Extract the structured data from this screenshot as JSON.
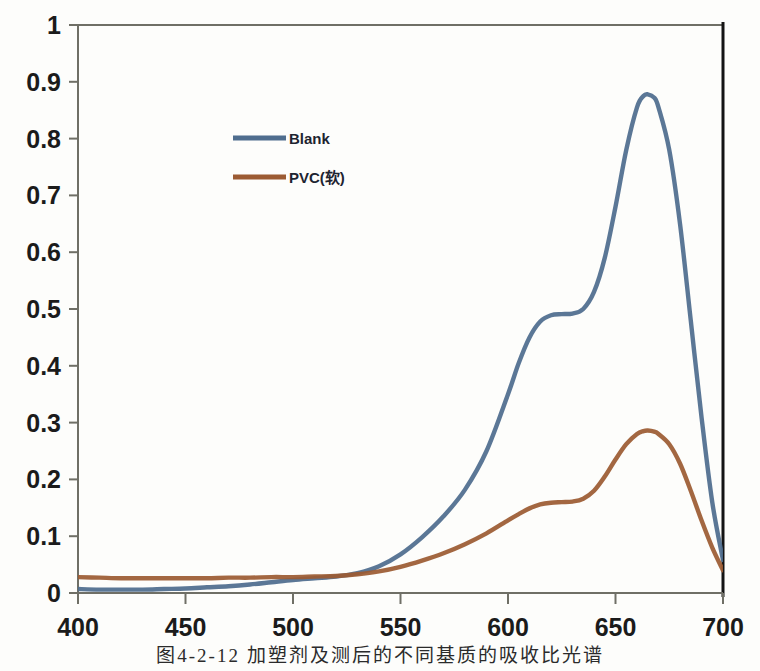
{
  "figure": {
    "caption": "图4-2-12  加塑剂及测后的不同基质的吸收比光谱"
  },
  "chart_data": {
    "type": "line",
    "title": "",
    "xlabel": "",
    "ylabel": "",
    "xlim": [
      400,
      700
    ],
    "ylim": [
      0,
      1
    ],
    "xticks": [
      400,
      450,
      500,
      550,
      600,
      650,
      700
    ],
    "yticks": [
      0,
      0.1,
      0.2,
      0.3,
      0.4,
      0.5,
      0.6,
      0.7,
      0.8,
      0.9,
      1
    ],
    "xtick_labels": [
      "400",
      "450",
      "500",
      "550",
      "600",
      "650",
      "700"
    ],
    "ytick_labels": [
      "0",
      "0.1",
      "0.2",
      "0.3",
      "0.4",
      "0.5",
      "0.6",
      "0.7",
      "0.8",
      "0.9",
      "1"
    ],
    "grid": false,
    "legend_position": "upper-center-left",
    "series": [
      {
        "name": "Blank",
        "color": "#4F6D8E",
        "x": [
          400,
          410,
          420,
          430,
          440,
          450,
          460,
          470,
          480,
          490,
          500,
          510,
          520,
          530,
          540,
          550,
          560,
          570,
          580,
          590,
          600,
          605,
          610,
          615,
          620,
          625,
          630,
          635,
          640,
          645,
          650,
          655,
          660,
          663,
          665,
          668,
          670,
          675,
          680,
          685,
          690,
          695,
          700
        ],
        "y": [
          0.007,
          0.006,
          0.006,
          0.006,
          0.007,
          0.008,
          0.01,
          0.012,
          0.015,
          0.019,
          0.023,
          0.026,
          0.029,
          0.035,
          0.047,
          0.068,
          0.098,
          0.135,
          0.182,
          0.25,
          0.35,
          0.405,
          0.45,
          0.478,
          0.489,
          0.491,
          0.492,
          0.5,
          0.53,
          0.59,
          0.68,
          0.78,
          0.855,
          0.875,
          0.878,
          0.872,
          0.855,
          0.78,
          0.65,
          0.48,
          0.31,
          0.16,
          0.058
        ]
      },
      {
        "name": "PVC(软)",
        "color": "#9C5B33",
        "x": [
          400,
          410,
          420,
          430,
          440,
          450,
          460,
          470,
          480,
          490,
          500,
          510,
          520,
          530,
          540,
          550,
          560,
          570,
          580,
          590,
          600,
          605,
          610,
          615,
          620,
          625,
          630,
          635,
          640,
          645,
          650,
          655,
          660,
          663,
          665,
          668,
          670,
          675,
          680,
          685,
          690,
          695,
          700
        ],
        "y": [
          0.028,
          0.027,
          0.026,
          0.026,
          0.026,
          0.026,
          0.026,
          0.027,
          0.027,
          0.028,
          0.028,
          0.029,
          0.03,
          0.033,
          0.038,
          0.046,
          0.057,
          0.07,
          0.086,
          0.105,
          0.128,
          0.139,
          0.149,
          0.156,
          0.159,
          0.16,
          0.161,
          0.166,
          0.18,
          0.205,
          0.235,
          0.262,
          0.28,
          0.285,
          0.286,
          0.284,
          0.28,
          0.262,
          0.228,
          0.18,
          0.128,
          0.08,
          0.04
        ]
      }
    ],
    "legend": [
      {
        "label": "Blank",
        "color": "#4F6D8E"
      },
      {
        "label": "PVC(软)",
        "color": "#9C5B33"
      }
    ],
    "axes_geometry": {
      "left_px": 78,
      "right_px": 723,
      "top_px": 25,
      "bottom_px": 593
    }
  }
}
